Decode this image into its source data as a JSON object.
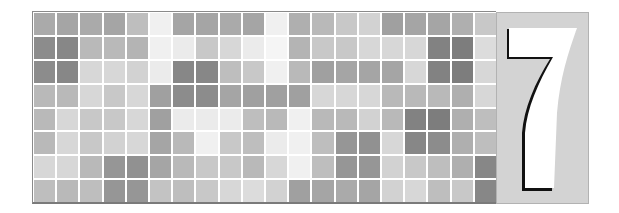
{
  "image": {
    "description": "Chapter header: gray mosaic tile grid with chapter number panel",
    "chapter_number": "7"
  },
  "mosaic": {
    "rows": 8,
    "columns": 20,
    "gray_levels": [
      [
        170,
        165,
        170,
        165,
        190,
        240,
        165,
        165,
        170,
        165,
        240,
        175,
        185,
        200,
        210,
        160,
        165,
        165,
        175,
        200
      ],
      [
        140,
        135,
        185,
        185,
        180,
        240,
        235,
        200,
        215,
        235,
        245,
        180,
        200,
        200,
        215,
        215,
        215,
        130,
        125,
        220
      ],
      [
        140,
        135,
        215,
        215,
        210,
        235,
        135,
        135,
        190,
        200,
        240,
        185,
        160,
        165,
        165,
        165,
        215,
        130,
        125,
        215
      ],
      [
        185,
        185,
        215,
        200,
        215,
        160,
        140,
        140,
        165,
        160,
        160,
        160,
        215,
        215,
        215,
        185,
        185,
        185,
        175,
        215
      ],
      [
        185,
        215,
        200,
        200,
        215,
        160,
        235,
        235,
        235,
        190,
        185,
        240,
        185,
        185,
        210,
        185,
        130,
        125,
        175,
        190
      ],
      [
        185,
        215,
        200,
        210,
        215,
        165,
        185,
        240,
        200,
        190,
        235,
        240,
        190,
        150,
        145,
        215,
        135,
        140,
        175,
        190
      ],
      [
        215,
        215,
        185,
        150,
        145,
        165,
        185,
        200,
        200,
        185,
        215,
        240,
        190,
        150,
        150,
        210,
        200,
        190,
        175,
        135
      ],
      [
        190,
        185,
        190,
        150,
        150,
        195,
        190,
        200,
        215,
        220,
        210,
        160,
        165,
        170,
        165,
        210,
        215,
        190,
        200,
        135
      ]
    ]
  },
  "colors": {
    "panel_background": "#d3d3d3",
    "panel_border": "#b2b2b2",
    "numeral_fill": "#ffffff",
    "numeral_shadow": "#111111",
    "grid_gap": "#ffffff"
  }
}
